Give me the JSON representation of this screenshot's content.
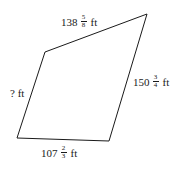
{
  "figure": {
    "shape": "quadrilateral",
    "vertices": {
      "top_left": [
        45,
        52
      ],
      "top_right": [
        147,
        14
      ],
      "bottom_right": [
        109,
        141
      ],
      "bottom_left": [
        17,
        138
      ]
    },
    "stroke_color": "#1a1a1a",
    "sides": [
      {
        "id": "top",
        "whole": "138",
        "num": "5",
        "den": "8",
        "unit": "ft"
      },
      {
        "id": "right",
        "whole": "150",
        "num": "3",
        "den": "4",
        "unit": "ft"
      },
      {
        "id": "bottom",
        "whole": "107",
        "num": "2",
        "den": "3",
        "unit": "ft"
      },
      {
        "id": "left",
        "text": "? ft"
      }
    ]
  }
}
